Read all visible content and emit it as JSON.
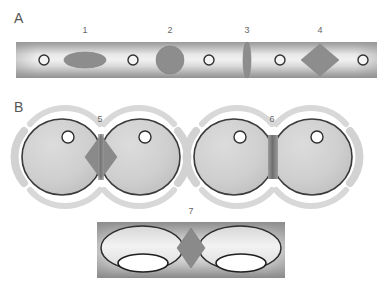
{
  "figure": {
    "background_color": "#ffffff",
    "panels": [
      {
        "id": "panel-a",
        "letter": "A",
        "description": "Cylindrical tube with internal structures",
        "labels": [
          {
            "text": "1",
            "x": 85,
            "y": 33
          },
          {
            "text": "2",
            "x": 170,
            "y": 33
          },
          {
            "text": "3",
            "x": 247,
            "y": 33
          },
          {
            "text": "4",
            "x": 320,
            "y": 33
          }
        ],
        "structures": [
          {
            "name": "ring-0",
            "shape": "ring",
            "cx": 44,
            "cy": 60,
            "rx": 5,
            "ry": 5
          },
          {
            "name": "structure-1",
            "shape": "ellipse-horizontal",
            "cx": 85,
            "cy": 60,
            "rx": 21,
            "ry": 8
          },
          {
            "name": "ring-1",
            "shape": "ring",
            "cx": 133,
            "cy": 60,
            "rx": 5,
            "ry": 5
          },
          {
            "name": "structure-2",
            "shape": "circle",
            "cx": 170,
            "cy": 60,
            "rx": 14,
            "ry": 14
          },
          {
            "name": "ring-2",
            "shape": "ring",
            "cx": 209,
            "cy": 60,
            "rx": 5,
            "ry": 5
          },
          {
            "name": "structure-3",
            "shape": "ellipse-vertical",
            "cx": 247,
            "cy": 60,
            "rx": 4,
            "ry": 18
          },
          {
            "name": "ring-3",
            "shape": "ring",
            "cx": 280,
            "cy": 60,
            "rx": 5,
            "ry": 5
          },
          {
            "name": "structure-4",
            "shape": "diamond",
            "cx": 320,
            "cy": 60,
            "rx": 19,
            "ry": 16
          },
          {
            "name": "ring-4",
            "shape": "ring",
            "cx": 363,
            "cy": 60,
            "rx": 5,
            "ry": 5
          }
        ]
      },
      {
        "id": "panel-b",
        "letter": "B",
        "description": "Two dividing cell pairs joined by septum bridges",
        "labels": [
          {
            "text": "5",
            "x": 100,
            "y": 122
          },
          {
            "text": "6",
            "x": 272,
            "y": 122
          }
        ],
        "cell_pairs": [
          {
            "name": "cell-pair-5",
            "left_cell": {
              "cx": 62,
              "cy": 157,
              "rx": 40,
              "ry": 38
            },
            "right_cell": {
              "cx": 140,
              "cy": 157,
              "rx": 40,
              "ry": 38
            },
            "left_vacuole": {
              "cx": 68,
              "cy": 137,
              "r": 6
            },
            "right_vacuole": {
              "cx": 145,
              "cy": 137,
              "r": 6
            },
            "bridge": {
              "shape": "diamond-wide",
              "cx": 101,
              "cy": 157,
              "rx": 16,
              "ry": 22
            }
          },
          {
            "name": "cell-pair-6",
            "left_cell": {
              "cx": 234,
              "cy": 157,
              "rx": 40,
              "ry": 38
            },
            "right_cell": {
              "cx": 312,
              "cy": 157,
              "rx": 40,
              "ry": 38
            },
            "left_vacuole": {
              "cx": 240,
              "cy": 137,
              "r": 6
            },
            "right_vacuole": {
              "cx": 317,
              "cy": 137,
              "r": 6
            },
            "bridge": {
              "shape": "bar-narrow",
              "cx": 273,
              "cy": 157,
              "rx": 5,
              "ry": 22
            }
          }
        ]
      },
      {
        "id": "panel-c",
        "letter": "",
        "description": "Two ellipsoidal cells with white vacuoles joined by a dark septum, on a shaded rectangle",
        "labels": [
          {
            "text": "7",
            "x": 191,
            "y": 214
          }
        ],
        "frame": {
          "x": 97,
          "y": 222,
          "width": 188,
          "height": 56
        },
        "cells": [
          {
            "name": "cell-left",
            "body": {
              "cx": 142,
              "cy": 248,
              "rx": 41,
              "ry": 22
            },
            "vacuole": {
              "cx": 143,
              "cy": 263,
              "rx": 25,
              "ry": 9
            }
          },
          {
            "name": "cell-right",
            "body": {
              "cx": 240,
              "cy": 248,
              "rx": 41,
              "ry": 22
            },
            "vacuole": {
              "cx": 241,
              "cy": 263,
              "rx": 25,
              "ry": 9
            }
          }
        ],
        "bridge": {
          "shape": "diamond",
          "cx": 191,
          "cy": 248,
          "rx": 14,
          "ry": 20
        }
      }
    ],
    "colors": {
      "tube_light": "#f2f2f2",
      "tube_mid": "#bdbdbd",
      "tube_dark": "#9a9a9a",
      "structure_fill": "#8d8d8d",
      "cell_fill": "#cccccc",
      "cell_stroke": "#333333",
      "halo_fill": "#dedede",
      "bridge_dark": "#7d7d7d",
      "vacuole_white": "#ffffff",
      "label_text": "#666666",
      "panel_letter": "#555555"
    }
  }
}
